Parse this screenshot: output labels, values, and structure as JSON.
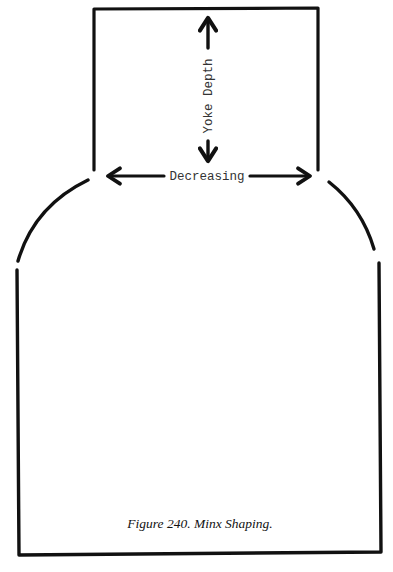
{
  "figure": {
    "caption": "Figure 240. Minx Shaping.",
    "labels": {
      "vertical_dimension": "Yoke Depth",
      "horizontal_dimension": "Decreasing"
    },
    "parts": [
      {
        "name": "yoke",
        "shape": "rectangle-open-bottom"
      },
      {
        "name": "shoulder-left",
        "shape": "arc"
      },
      {
        "name": "shoulder-right",
        "shape": "arc"
      },
      {
        "name": "body",
        "shape": "rectangle-open-top"
      }
    ],
    "colors": {
      "ink": "#111111",
      "background": "#ffffff"
    }
  }
}
